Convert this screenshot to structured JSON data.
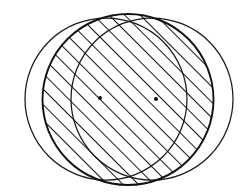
{
  "figure": {
    "type": "geometric-diagram",
    "canvas": {
      "width": 252,
      "height": 196,
      "background": "#ffffff"
    },
    "stroke_color": "#1a1a1a",
    "hatch_color": "#141414",
    "shapes": {
      "left_circle": {
        "label": "left-circle",
        "cx": 106.0,
        "cy": 99.0,
        "r": 81.0,
        "stroke": "#1a1a1a",
        "stroke_width": 1.25,
        "fill": "none"
      },
      "right_circle": {
        "label": "right-circle",
        "cx": 152.0,
        "cy": 99.0,
        "r": 81.0,
        "stroke": "#1a1a1a",
        "stroke_width": 1.25,
        "fill": "none"
      }
    },
    "intersection": {
      "label": "lens-region",
      "shaded": true,
      "hatch_angle_deg": 45,
      "hatch_direction": "bottom-left-to-top-right",
      "hatch_spacing_px": 11,
      "hatch_line_width": 2.0,
      "top_point": {
        "x": 128.0,
        "y": 14.0
      },
      "bottom_point": {
        "x": 128.0,
        "y": 185.0
      },
      "left_extent_x": 71.0,
      "right_extent_x": 187.0,
      "outline_stroke_width": 1.9
    },
    "center_points": [
      {
        "label": "left-circle-center",
        "x": 100.0,
        "y": 98.0,
        "radius": 2.0,
        "fill": "#101010"
      },
      {
        "label": "right-circle-center",
        "x": 156.0,
        "y": 99.0,
        "radius": 2.0,
        "fill": "#101010"
      }
    ]
  }
}
